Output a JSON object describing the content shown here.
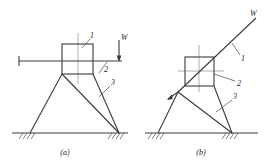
{
  "figure": {
    "panels": [
      {
        "id": "a",
        "caption": "(a)",
        "labels": [
          {
            "key": "part1",
            "text": "1"
          },
          {
            "key": "part2",
            "text": "2"
          },
          {
            "key": "part3",
            "text": "3"
          },
          {
            "key": "load",
            "text": "W"
          }
        ]
      },
      {
        "id": "b",
        "caption": "(b)",
        "labels": [
          {
            "key": "part1",
            "text": "1"
          },
          {
            "key": "part2",
            "text": "2"
          },
          {
            "key": "part3",
            "text": "3"
          },
          {
            "key": "load",
            "text": "W"
          }
        ]
      }
    ],
    "colors": {
      "line": "#3a3a3a",
      "thin_line": "#6b6b6b",
      "center_line": "#9a9a9a",
      "leader": "#4a4a4a",
      "background": "#ffffff"
    }
  }
}
